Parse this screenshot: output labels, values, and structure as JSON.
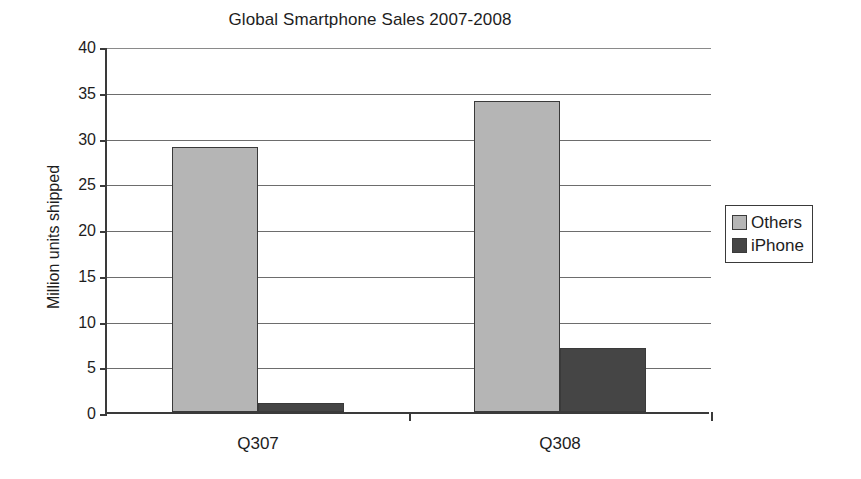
{
  "chart_data": {
    "type": "bar",
    "title": "Global Smartphone Sales 2007-2008",
    "xlabel": "",
    "ylabel": "Million units shipped",
    "categories": [
      "Q307",
      "Q308"
    ],
    "series": [
      {
        "name": "Others",
        "values": [
          29,
          34
        ],
        "color": "#b5b5b5"
      },
      {
        "name": "iPhone",
        "values": [
          1,
          7
        ],
        "color": "#454545"
      }
    ],
    "ylim": [
      0,
      40
    ],
    "yticks": [
      0,
      5,
      10,
      15,
      20,
      25,
      30,
      35,
      40
    ],
    "ytick_labels": [
      "0",
      "5",
      "10",
      "15",
      "20",
      "25",
      "30",
      "35",
      "40"
    ],
    "grid": true,
    "grid_axis": "y",
    "legend_position": "right",
    "legend_entries": [
      "Others",
      "iPhone"
    ]
  },
  "colors": {
    "others": "#b5b5b5",
    "iphone": "#454545",
    "axis": "#3a3a3a",
    "gridline": "#6d6d6d",
    "text": "#1d1d1d",
    "background": "#ffffff"
  }
}
